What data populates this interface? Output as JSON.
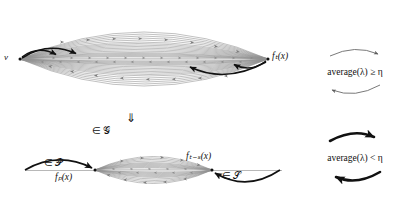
{
  "figure": {
    "background": "#ffffff",
    "ink_color": "#111111",
    "thin_arc_color": "#8a8a8a",
    "axis_color": "#9a9a9a",
    "upper_graph": {
      "name": "upper-lens-graph",
      "left_vertex_label": "v",
      "right_vertex_label": "fₜ(x)",
      "description": "lens of nested directed arcs from v to f_t(x)"
    },
    "implication": {
      "arrow_glyph": "⇓",
      "membership_label": "∈ 𝒢"
    },
    "lower_graph": {
      "name": "lower-lens-graph",
      "left_vertex_label": "fₚ(x)",
      "right_vertex_label": "fₜ₋ₛ(x)",
      "prefix_label": "∈ 𝒫",
      "suffix_label": "∈ 𝒮"
    },
    "conditions": [
      {
        "id": "condition-high",
        "text": "average(λ) ≥ η",
        "cycle_style": "thin",
        "color": "#555555"
      },
      {
        "id": "condition-low",
        "text": "average(λ) < η",
        "cycle_style": "thick",
        "color": "#111111"
      }
    ]
  }
}
